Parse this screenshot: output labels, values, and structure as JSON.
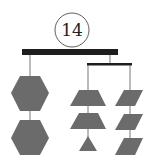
{
  "puzzle": {
    "number": "14",
    "type": "balance-mobile",
    "colors": {
      "shape_fill": "#6b6b6b",
      "bar": "#1e1e1e",
      "string": "#555555",
      "circle": "#333333"
    },
    "left_chain": {
      "shapes": [
        "hexagon",
        "hexagon"
      ]
    },
    "right_subbar": {
      "left_chain": {
        "shapes": [
          "trapezoid",
          "trapezoid",
          "triangle"
        ]
      },
      "right_chain": {
        "shapes": [
          "parallelogram",
          "parallelogram",
          "parallelogram"
        ]
      }
    }
  }
}
